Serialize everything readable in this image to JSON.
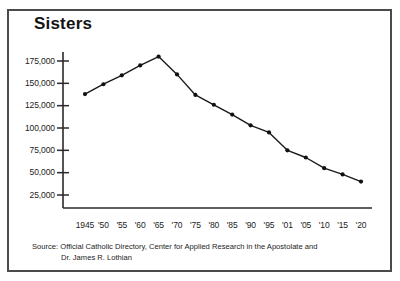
{
  "chart_data": {
    "type": "line",
    "title": "Sisters",
    "xlabel": "",
    "ylabel": "",
    "grid": false,
    "legend": "none",
    "categories": [
      "1945",
      "'50",
      "'55",
      "'60",
      "'65",
      "'70",
      "'75",
      "'80",
      "'85",
      "'90",
      "'95",
      "'01",
      "'05",
      "'10",
      "'15",
      "'20"
    ],
    "x_tick_labels": [
      "1945",
      "'50",
      "'55",
      "'60",
      "'65",
      "'70",
      "'75",
      "'80",
      "'85",
      "'90",
      "'95",
      "'01",
      "'05",
      "'10",
      "'15",
      "'20"
    ],
    "y_tick_labels": [
      "175,000",
      "150,000",
      "125,000",
      "100,000",
      "75,000",
      "50,000",
      "25,000"
    ],
    "y_tick_values": [
      175000,
      150000,
      125000,
      100000,
      75000,
      50000,
      25000
    ],
    "ylim": [
      0,
      190000
    ],
    "values": [
      138000,
      149000,
      159000,
      170000,
      180000,
      160000,
      137000,
      126000,
      115000,
      103000,
      95000,
      75000,
      67000,
      55000,
      48000,
      40000
    ],
    "series": [
      {
        "name": "Sisters",
        "values": [
          138000,
          149000,
          159000,
          170000,
          180000,
          160000,
          137000,
          126000,
          115000,
          103000,
          95000,
          75000,
          67000,
          55000,
          48000,
          40000
        ]
      }
    ],
    "marker": "circle",
    "line_color": "#1a1a1a",
    "marker_color": "#111111"
  },
  "source": {
    "line1": "Source: Official Catholic Directory, Center for Applied Research in the Apostolate and",
    "line2": "Dr. James R. Lothian"
  },
  "colors": {
    "frame_border": "#4b4b4b",
    "axis": "#2a2a2a",
    "background": "#ffffff",
    "text": "#1a1a1a"
  }
}
